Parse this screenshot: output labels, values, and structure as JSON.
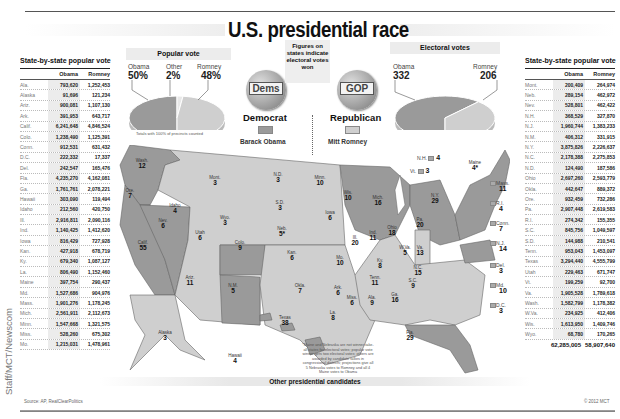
{
  "title": "U.S. presidential race",
  "credit": "Staff/MCT/Newscom",
  "source": "Source: AP, RealClearPolitics",
  "copyright": "© 2012 MCT",
  "other_candidates_label": "Other presidential candidates",
  "legend": {
    "figures_note": "Figures on states indicate electoral votes won",
    "dem_badge": "Dems",
    "gop_badge": "GOP",
    "democrat": "Democrat",
    "republican": "Republican",
    "democrat_candidate": "Barack Obama",
    "republican_candidate": "Mitt Romney",
    "democrat_color": "#9a9a9a",
    "republican_color": "#cfcfcf"
  },
  "map_footnote": "*Maine and Nebraska are not winner-take-all states for electoral votes; popular vote winner gets two electoral votes; others are awarded by candidate tallies in congressional districts; projections give all 5 Nebraska votes to Romney and all 4 Maine votes to Obama",
  "chart_data": [
    {
      "type": "pie",
      "title": "Popular vote",
      "labels": [
        "Obama",
        "Other",
        "Romney"
      ],
      "display": [
        "50%",
        "2%",
        "48%"
      ],
      "values": [
        50,
        2,
        48
      ],
      "note": "Totals with 100% of precincts counted"
    },
    {
      "type": "pie",
      "title": "Electoral votes",
      "labels": [
        "Obama",
        "Romney"
      ],
      "values": [
        332,
        206
      ]
    },
    {
      "type": "table",
      "title": "State-by-state popular vote",
      "columns": [
        "",
        "Obama",
        "Romney"
      ],
      "left_rows": [
        [
          "Ala.",
          "793,620",
          "1,252,453"
        ],
        [
          "Alaska",
          "91,696",
          "121,234"
        ],
        [
          "Ariz.",
          "900,081",
          "1,107,130"
        ],
        [
          "Ark.",
          "391,953",
          "643,717"
        ],
        [
          "Calif.",
          "6,241,648",
          "4,846,524"
        ],
        [
          "Colo.",
          "1,238,490",
          "1,125,391"
        ],
        [
          "Conn.",
          "912,531",
          "631,432"
        ],
        [
          "D.C.",
          "222,332",
          "17,337"
        ],
        [
          "Del.",
          "242,547",
          "165,476"
        ],
        [
          "Fla.",
          "4,235,270",
          "4,162,081"
        ],
        [
          "Ga.",
          "1,761,761",
          "2,078,221"
        ],
        [
          "Hawaii",
          "303,090",
          "119,494"
        ],
        [
          "Idaho",
          "212,560",
          "420,750"
        ],
        [
          "Ill.",
          "2,916,811",
          "2,090,116"
        ],
        [
          "Ind.",
          "1,140,425",
          "1,412,620"
        ],
        [
          "Iowa",
          "816,429",
          "727,928"
        ],
        [
          "Kan.",
          "427,918",
          "678,719"
        ],
        [
          "Ky.",
          "679,340",
          "1,087,127"
        ],
        [
          "La.",
          "806,490",
          "1,152,460"
        ],
        [
          "Maine",
          "397,754",
          "290,437"
        ],
        [
          "Md.",
          "1,527,686",
          "904,976"
        ],
        [
          "Mass.",
          "1,901,276",
          "1,178,245"
        ],
        [
          "Mich.",
          "2,561,911",
          "2,112,673"
        ],
        [
          "Minn.",
          "1,547,668",
          "1,321,575"
        ],
        [
          "Miss.",
          "528,260",
          "675,302"
        ],
        [
          "Mo.",
          "1,215,031",
          "1,478,961"
        ]
      ],
      "right_rows": [
        [
          "Mont.",
          "200,409",
          "264,974"
        ],
        [
          "Neb.",
          "289,154",
          "462,972"
        ],
        [
          "Nev.",
          "528,801",
          "462,422"
        ],
        [
          "N.H.",
          "368,529",
          "327,870"
        ],
        [
          "N.J.",
          "1,960,744",
          "1,383,233"
        ],
        [
          "N.M.",
          "406,312",
          "331,915"
        ],
        [
          "N.Y.",
          "3,875,826",
          "2,226,637"
        ],
        [
          "N.C.",
          "2,178,388",
          "2,275,853"
        ],
        [
          "N.D.",
          "124,490",
          "187,586"
        ],
        [
          "Ohio",
          "2,697,260",
          "2,593,779"
        ],
        [
          "Okla.",
          "442,647",
          "889,372"
        ],
        [
          "Ore.",
          "932,459",
          "732,286"
        ],
        [
          "Pa.",
          "2,907,448",
          "2,619,583"
        ],
        [
          "R.I.",
          "274,342",
          "155,355"
        ],
        [
          "S.C.",
          "845,756",
          "1,049,597"
        ],
        [
          "S.D.",
          "144,988",
          "210,541"
        ],
        [
          "Tenn.",
          "953,043",
          "1,453,097"
        ],
        [
          "Texas",
          "3,294,440",
          "4,555,799"
        ],
        [
          "Utah",
          "229,463",
          "671,747"
        ],
        [
          "Vt.",
          "199,259",
          "92,700"
        ],
        [
          "Va.",
          "1,905,528",
          "1,789,618"
        ],
        [
          "Wash.",
          "1,582,799",
          "1,178,382"
        ],
        [
          "W.Va.",
          "234,925",
          "412,406"
        ],
        [
          "Wis.",
          "1,613,950",
          "1,409,746"
        ],
        [
          "Wyo.",
          "68,780",
          "170,265"
        ]
      ],
      "totals": [
        "62,285,005",
        "58,907,640"
      ]
    },
    {
      "type": "map",
      "title": "Electoral votes by state",
      "states": [
        {
          "name": "Wash.",
          "ev": "12",
          "winner": "Obama"
        },
        {
          "name": "Ore.",
          "ev": "7",
          "winner": "Obama"
        },
        {
          "name": "Calif.",
          "ev": "55",
          "winner": "Obama"
        },
        {
          "name": "Nev.",
          "ev": "6",
          "winner": "Obama"
        },
        {
          "name": "Idaho",
          "ev": "4",
          "winner": "Romney"
        },
        {
          "name": "Mont.",
          "ev": "3",
          "winner": "Romney"
        },
        {
          "name": "Wyo.",
          "ev": "3",
          "winner": "Romney"
        },
        {
          "name": "Utah",
          "ev": "6",
          "winner": "Romney"
        },
        {
          "name": "Colo.",
          "ev": "9",
          "winner": "Obama"
        },
        {
          "name": "Ariz.",
          "ev": "11",
          "winner": "Romney"
        },
        {
          "name": "N.M.",
          "ev": "5",
          "winner": "Obama"
        },
        {
          "name": "N.D.",
          "ev": "3",
          "winner": "Romney"
        },
        {
          "name": "S.D.",
          "ev": "3",
          "winner": "Romney"
        },
        {
          "name": "Neb.",
          "ev": "5*",
          "winner": "Romney"
        },
        {
          "name": "Kan.",
          "ev": "6",
          "winner": "Romney"
        },
        {
          "name": "Okla.",
          "ev": "7",
          "winner": "Romney"
        },
        {
          "name": "Texas",
          "ev": "38",
          "winner": "Romney"
        },
        {
          "name": "Minn.",
          "ev": "10",
          "winner": "Obama"
        },
        {
          "name": "Iowa",
          "ev": "6",
          "winner": "Obama"
        },
        {
          "name": "Mo.",
          "ev": "10",
          "winner": "Romney"
        },
        {
          "name": "Ark.",
          "ev": "6",
          "winner": "Romney"
        },
        {
          "name": "La.",
          "ev": "8",
          "winner": "Romney"
        },
        {
          "name": "Wis.",
          "ev": "10",
          "winner": "Obama"
        },
        {
          "name": "Ill.",
          "ev": "20",
          "winner": "Obama"
        },
        {
          "name": "Mich.",
          "ev": "16",
          "winner": "Obama"
        },
        {
          "name": "Ind.",
          "ev": "11",
          "winner": "Romney"
        },
        {
          "name": "Ohio",
          "ev": "18",
          "winner": "Obama"
        },
        {
          "name": "Ky.",
          "ev": "8",
          "winner": "Romney"
        },
        {
          "name": "Tenn.",
          "ev": "11",
          "winner": "Romney"
        },
        {
          "name": "Miss.",
          "ev": "6",
          "winner": "Romney"
        },
        {
          "name": "Ala.",
          "ev": "9",
          "winner": "Romney"
        },
        {
          "name": "Ga.",
          "ev": "16",
          "winner": "Romney"
        },
        {
          "name": "Fla.",
          "ev": "29",
          "winner": "Obama"
        },
        {
          "name": "S.C.",
          "ev": "9",
          "winner": "Romney"
        },
        {
          "name": "N.C.",
          "ev": "15",
          "winner": "Romney"
        },
        {
          "name": "Va.",
          "ev": "13",
          "winner": "Obama"
        },
        {
          "name": "W.Va.",
          "ev": "5",
          "winner": "Romney"
        },
        {
          "name": "Pa.",
          "ev": "20",
          "winner": "Obama"
        },
        {
          "name": "N.Y.",
          "ev": "29",
          "winner": "Obama"
        },
        {
          "name": "Maine",
          "ev": "4*",
          "winner": "Obama"
        },
        {
          "name": "Alaska",
          "ev": "3",
          "winner": "Romney"
        },
        {
          "name": "Hawaii",
          "ev": "4",
          "winner": "Obama"
        }
      ],
      "callouts": [
        {
          "name": "N.H.",
          "ev": "4",
          "winner": "Obama"
        },
        {
          "name": "Vt.",
          "ev": "3",
          "winner": "Obama"
        },
        {
          "name": "Mass.",
          "ev": "11",
          "winner": "Obama"
        },
        {
          "name": "R.I.",
          "ev": "4",
          "winner": "Obama"
        },
        {
          "name": "Conn.",
          "ev": "7",
          "winner": "Obama"
        },
        {
          "name": "N.J.",
          "ev": "14",
          "winner": "Obama"
        },
        {
          "name": "Del.",
          "ev": "3",
          "winner": "Obama"
        },
        {
          "name": "Md.",
          "ev": "10",
          "winner": "Obama"
        },
        {
          "name": "D.C.",
          "ev": "3",
          "winner": "Obama"
        }
      ]
    }
  ]
}
